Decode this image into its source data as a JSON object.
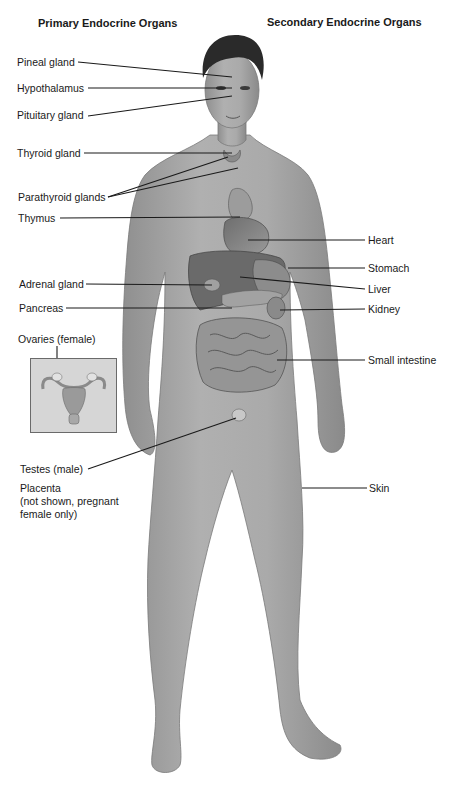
{
  "headings": {
    "primary": "Primary Endocrine Organs",
    "secondary": "Secondary Endocrine Organs"
  },
  "primary_labels": [
    {
      "id": "pineal",
      "text": "Pineal gland"
    },
    {
      "id": "hypothalamus",
      "text": "Hypothalamus"
    },
    {
      "id": "pituitary",
      "text": "Pituitary gland"
    },
    {
      "id": "thyroid",
      "text": "Thyroid gland"
    },
    {
      "id": "parathyroid",
      "text": "Parathyroid glands"
    },
    {
      "id": "thymus",
      "text": "Thymus"
    },
    {
      "id": "adrenal",
      "text": "Adrenal gland"
    },
    {
      "id": "pancreas",
      "text": "Pancreas"
    },
    {
      "id": "ovaries",
      "text": "Ovaries (female)"
    },
    {
      "id": "testes",
      "text": "Testes (male)"
    },
    {
      "id": "placenta",
      "text": "Placenta"
    },
    {
      "id": "placenta_note1",
      "text": "(not shown, pregnant"
    },
    {
      "id": "placenta_note2",
      "text": "female only)"
    }
  ],
  "secondary_labels": [
    {
      "id": "heart",
      "text": "Heart"
    },
    {
      "id": "stomach",
      "text": "Stomach"
    },
    {
      "id": "liver",
      "text": "Liver"
    },
    {
      "id": "kidney",
      "text": "Kidney"
    },
    {
      "id": "small_intestine",
      "text": "Small intestine"
    },
    {
      "id": "skin",
      "text": "Skin"
    }
  ],
  "colors": {
    "skin": "#a9a9a9",
    "skin_shadow": "#8c8c8c",
    "organ": "#7d7d7d",
    "hair": "#2a2a2a",
    "leader_line": "#1a1a1a",
    "inset_bg": "#d6d6d6"
  }
}
